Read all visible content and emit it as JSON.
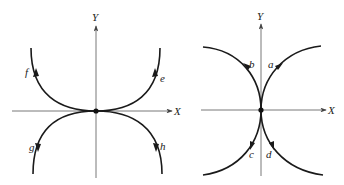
{
  "diagrams": [
    {
      "name": "left-phase-portrait",
      "axis_labels": {
        "x": "X",
        "y": "Y"
      },
      "curve_labels": {
        "e": "e",
        "f": "f",
        "g": "g",
        "h": "h"
      }
    },
    {
      "name": "right-phase-portrait",
      "axis_labels": {
        "x": "X",
        "y": "Y"
      },
      "curve_labels": {
        "a": "a",
        "b": "b",
        "c": "c",
        "d": "d"
      }
    }
  ],
  "colors": {
    "curve": "#1a1a1a",
    "axis": "#555555",
    "background": "#ffffff"
  }
}
